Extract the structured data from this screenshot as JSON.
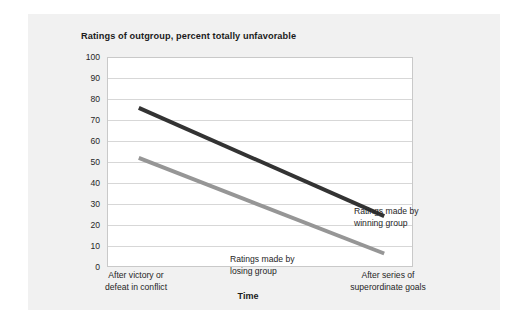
{
  "figure": {
    "title": "Ratings of outgroup, percent totally unfavorable",
    "background_color": "#f1f1f1",
    "plot_background_color": "#ffffff"
  },
  "chart_data": {
    "type": "line",
    "title": "Ratings of outgroup, percent totally unfavorable",
    "xlabel": "Time",
    "ylabel": "",
    "ylim": [
      0,
      100
    ],
    "ytick_labels": [
      "100",
      "90",
      "80",
      "70",
      "60",
      "50",
      "40",
      "30",
      "20",
      "10",
      "0"
    ],
    "yticks": [
      100,
      90,
      80,
      70,
      60,
      50,
      40,
      30,
      20,
      10,
      0
    ],
    "grid": true,
    "legend_position": "inline-annotations",
    "categories": [
      "After victory or defeat in conflict",
      "After series of superordinate goals"
    ],
    "x": [
      0,
      1
    ],
    "xtick_labels": [
      {
        "line1": "After victory or",
        "line2": "defeat in conflict"
      },
      {
        "line1": "After series of",
        "line2": "superordinate goals"
      }
    ],
    "series": [
      {
        "name": "Ratings made by winning group",
        "annotation": {
          "line1": "Ratings made by",
          "line2": "winning group"
        },
        "color": "#333333",
        "values": [
          76,
          24
        ]
      },
      {
        "name": "Ratings made by losing group",
        "annotation": {
          "line1": "Ratings made by",
          "line2": "losing group"
        },
        "color": "#969696",
        "values": [
          52,
          6
        ]
      }
    ]
  }
}
